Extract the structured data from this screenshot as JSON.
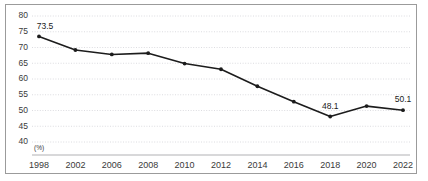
{
  "chart_data": {
    "type": "line",
    "title": "",
    "subtitle": "",
    "xlabel": "",
    "ylabel": "",
    "unit_label": "(%)",
    "categories": [
      "1998",
      "2002",
      "2006",
      "2008",
      "2010",
      "2012",
      "2014",
      "2016",
      "2018",
      "2020",
      "2022"
    ],
    "values": [
      73.5,
      69.2,
      67.8,
      68.2,
      64.9,
      63.1,
      57.7,
      52.8,
      48.1,
      51.4,
      50.1
    ],
    "series": [
      {
        "name": "",
        "values": [
          73.5,
          69.2,
          67.8,
          68.2,
          64.9,
          63.1,
          57.7,
          52.8,
          48.1,
          51.4,
          50.1
        ]
      }
    ],
    "point_labels": [
      {
        "index": 0,
        "text": "73.5"
      },
      {
        "index": 8,
        "text": "48.1"
      },
      {
        "index": 10,
        "text": "50.1"
      }
    ],
    "ylim": [
      40,
      80
    ],
    "yticks": [
      40,
      45,
      50,
      55,
      60,
      65,
      70,
      75,
      80
    ],
    "ytick_labels": [
      "40",
      "45",
      "50",
      "55",
      "60",
      "65",
      "70",
      "75",
      "80"
    ],
    "grid": true,
    "grid_axis": "y",
    "legend": false,
    "legend_position": "none",
    "colors": {
      "line": "#1c1c1c",
      "marker": "#1c1c1c",
      "grid": "#d3d3d8",
      "axis": "#a8a8ac",
      "border": "#9b9b9b",
      "text": "#3a3a3a",
      "background": "#ffffff"
    }
  }
}
